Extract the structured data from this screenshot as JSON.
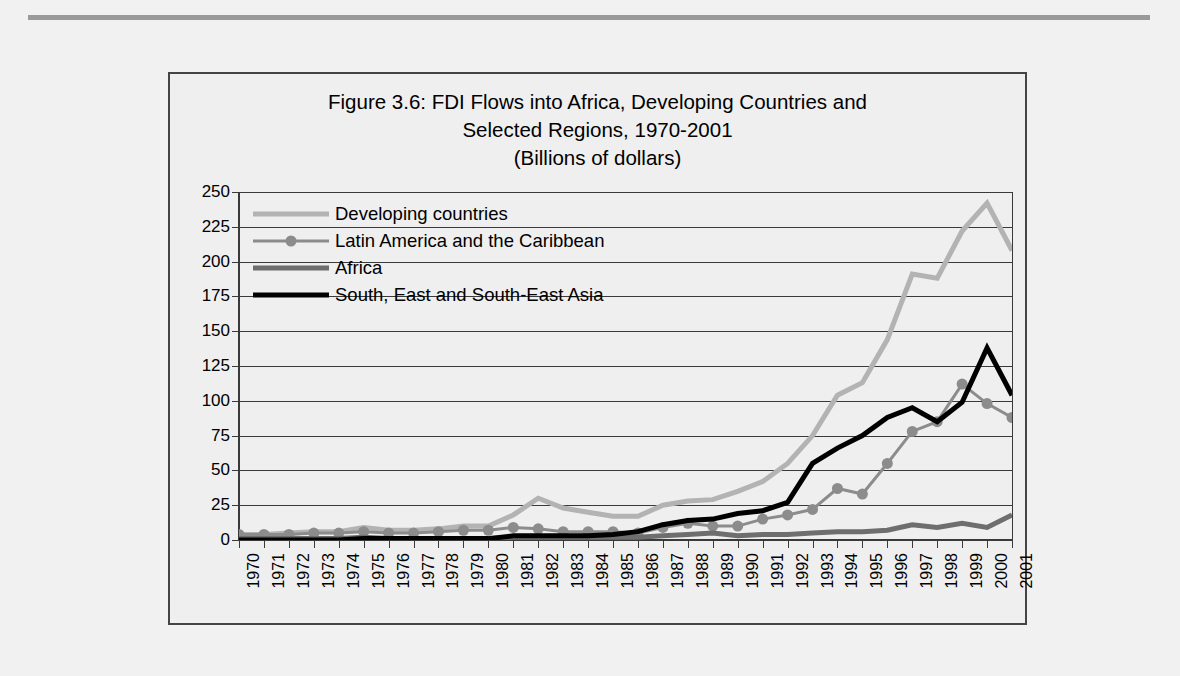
{
  "figure": {
    "title_lines": [
      "Figure 3.6: FDI Flows into Africa, Developing Countries and",
      "Selected Regions, 1970-2001",
      "(Billions of dollars)"
    ]
  },
  "colors": {
    "developing": "#b3b3b3",
    "latin_america": "#8c8c8c",
    "africa": "#6e6e6e",
    "asia": "#000000",
    "grid": "#3a3a3a",
    "frame": "#444444",
    "background": "#efefef",
    "page_background": "#f1f1f1",
    "top_rule": "#9a9a9a"
  },
  "chart_data": {
    "type": "line",
    "title": "Figure 3.6: FDI Flows into Africa, Developing Countries and Selected Regions, 1970-2001",
    "subtitle": "(Billions of dollars)",
    "xlabel": "",
    "ylabel": "",
    "ylim": [
      0,
      250
    ],
    "ytick_step": 25,
    "yticks": [
      0,
      25,
      50,
      75,
      100,
      125,
      150,
      175,
      200,
      225,
      250
    ],
    "ytick_labels": [
      "0",
      "25",
      "50",
      "75",
      "100",
      "125",
      "150",
      "175",
      "200",
      "225",
      "250"
    ],
    "grid": true,
    "legend_position": "upper-left-inside",
    "categories": [
      "1970",
      "1971",
      "1972",
      "1973",
      "1974",
      "1975",
      "1976",
      "1977",
      "1978",
      "1979",
      "1980",
      "1981",
      "1982",
      "1983",
      "1984",
      "1985",
      "1986",
      "1987",
      "1988",
      "1989",
      "1990",
      "1991",
      "1992",
      "1993",
      "1994",
      "1995",
      "1996",
      "1997",
      "1998",
      "1999",
      "2000",
      "2001"
    ],
    "series": [
      {
        "name": "Developing countries",
        "color": "#b3b3b3",
        "marker": "none",
        "width": 5,
        "values": [
          4,
          4,
          5,
          6,
          6,
          9,
          7,
          7,
          8,
          10,
          10,
          18,
          30,
          23,
          20,
          17,
          17,
          25,
          28,
          29,
          35,
          42,
          55,
          75,
          104,
          113,
          144,
          191,
          188,
          222,
          242,
          208
        ]
      },
      {
        "name": "Latin America and the Caribbean",
        "color": "#8c8c8c",
        "marker": "circle",
        "width": 3,
        "values": [
          4,
          4,
          4,
          5,
          5,
          6,
          5,
          5,
          6,
          7,
          7,
          9,
          8,
          6,
          6,
          6,
          5,
          9,
          12,
          10,
          10,
          15,
          18,
          22,
          37,
          33,
          55,
          78,
          85,
          112,
          98,
          88
        ]
      },
      {
        "name": "Africa",
        "color": "#6e6e6e",
        "marker": "none",
        "width": 5,
        "values": [
          1,
          1,
          1,
          1,
          1,
          2,
          1,
          1,
          1,
          1,
          1,
          2,
          2,
          2,
          2,
          2,
          2,
          3,
          4,
          5,
          3,
          4,
          4,
          5,
          6,
          6,
          7,
          11,
          9,
          12,
          9,
          18
        ]
      },
      {
        "name": "South, East and South-East Asia",
        "color": "#000000",
        "marker": "none",
        "width": 5,
        "values": [
          0,
          0,
          0,
          0,
          0,
          1,
          1,
          1,
          1,
          1,
          1,
          3,
          3,
          3,
          3,
          4,
          6,
          11,
          14,
          15,
          19,
          21,
          27,
          55,
          66,
          75,
          88,
          95,
          85,
          99,
          138,
          104
        ]
      }
    ]
  },
  "legend": {
    "items": [
      {
        "label": "Developing countries",
        "key": "developing"
      },
      {
        "label": "Latin America and the Caribbean",
        "key": "latin_america"
      },
      {
        "label": "Africa",
        "key": "africa"
      },
      {
        "label": "South, East and South-East Asia",
        "key": "asia"
      }
    ]
  }
}
